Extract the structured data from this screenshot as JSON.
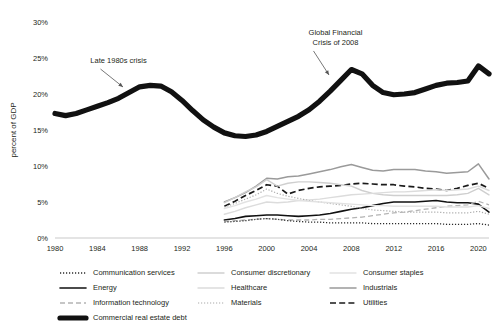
{
  "chart_data": {
    "type": "line",
    "title": "",
    "xlabel": "",
    "ylabel": "percent of GDP",
    "xlim": [
      1980,
      2021
    ],
    "ylim": [
      0,
      30
    ],
    "grid": false,
    "legend_position": "bottom",
    "x_ticks": [
      "1980",
      "1984",
      "1988",
      "1992",
      "1996",
      "2000",
      "2004",
      "2008",
      "2012",
      "2016",
      "2020"
    ],
    "y_ticks": [
      "0%",
      "5%",
      "10%",
      "15%",
      "20%",
      "25%",
      "30%"
    ],
    "annotations": [
      {
        "name": "late-1980s-crisis",
        "line1": "Late 1980s crisis",
        "line2": "",
        "x": 1986,
        "y": 24.3
      },
      {
        "name": "global-financial-crisis",
        "line1": "Global Financial",
        "line2": "Crisis of 2008",
        "x": 2006.5,
        "y": 28.2
      }
    ],
    "series": [
      {
        "name": "Commercial real estate debt",
        "style": "solid-thick",
        "color": "#111111",
        "x": [
          1980,
          1981,
          1982,
          1983,
          1984,
          1985,
          1986,
          1987,
          1988,
          1989,
          1990,
          1991,
          1992,
          1993,
          1994,
          1995,
          1996,
          1997,
          1998,
          1999,
          2000,
          2001,
          2002,
          2003,
          2004,
          2005,
          2006,
          2007,
          2008,
          2009,
          2010,
          2011,
          2012,
          2013,
          2014,
          2015,
          2016,
          2017,
          2018,
          2019,
          2020,
          2021
        ],
        "values": [
          17.3,
          17.0,
          17.3,
          17.8,
          18.3,
          18.8,
          19.4,
          20.2,
          21.0,
          21.2,
          21.1,
          20.3,
          19.1,
          17.7,
          16.4,
          15.4,
          14.6,
          14.2,
          14.1,
          14.3,
          14.8,
          15.5,
          16.2,
          16.9,
          17.8,
          19.0,
          20.4,
          21.9,
          23.4,
          22.8,
          21.2,
          20.2,
          19.9,
          20.0,
          20.2,
          20.7,
          21.2,
          21.5,
          21.6,
          21.8,
          23.9,
          22.8
        ]
      },
      {
        "name": "Industrials",
        "style": "solid-gray",
        "color": "#9a9a9a",
        "x": [
          1996,
          1997,
          1998,
          1999,
          2000,
          2001,
          2002,
          2003,
          2004,
          2005,
          2006,
          2007,
          2008,
          2009,
          2010,
          2011,
          2012,
          2013,
          2014,
          2015,
          2016,
          2017,
          2018,
          2019,
          2020,
          2021
        ],
        "values": [
          5.0,
          5.6,
          6.3,
          7.2,
          8.3,
          8.2,
          8.5,
          8.6,
          8.9,
          9.2,
          9.5,
          9.9,
          10.2,
          9.8,
          9.4,
          9.3,
          9.5,
          9.5,
          9.5,
          9.3,
          9.2,
          9.0,
          9.1,
          9.2,
          10.3,
          8.2
        ]
      },
      {
        "name": "Utilities",
        "style": "dashed-black",
        "color": "#1a1a1a",
        "x": [
          1996,
          1997,
          1998,
          1999,
          2000,
          2001,
          2002,
          2003,
          2004,
          2005,
          2006,
          2007,
          2008,
          2009,
          2010,
          2011,
          2012,
          2013,
          2014,
          2015,
          2016,
          2017,
          2018,
          2019,
          2020,
          2021
        ],
        "values": [
          4.4,
          5.1,
          5.9,
          6.6,
          7.4,
          7.2,
          6.1,
          6.6,
          6.9,
          7.1,
          7.2,
          7.3,
          7.5,
          7.6,
          7.5,
          7.4,
          7.4,
          7.2,
          7.1,
          6.9,
          6.8,
          6.6,
          6.9,
          7.3,
          7.6,
          6.9
        ]
      },
      {
        "name": "Energy",
        "style": "solid-black",
        "color": "#111111",
        "x": [
          1996,
          1997,
          1998,
          1999,
          2000,
          2001,
          2002,
          2003,
          2004,
          2005,
          2006,
          2007,
          2008,
          2009,
          2010,
          2011,
          2012,
          2013,
          2014,
          2015,
          2016,
          2017,
          2018,
          2019,
          2020,
          2021
        ],
        "values": [
          2.5,
          2.7,
          3.0,
          3.1,
          3.2,
          3.2,
          3.1,
          3.0,
          3.1,
          3.2,
          3.4,
          3.7,
          4.0,
          4.2,
          4.5,
          4.8,
          5.0,
          5.0,
          5.0,
          5.1,
          5.2,
          5.0,
          4.9,
          4.9,
          4.7,
          3.6
        ]
      },
      {
        "name": "Consumer discretionary",
        "style": "solid-light",
        "color": "#cfcfcf",
        "x": [
          1996,
          1997,
          1998,
          1999,
          2000,
          2001,
          2002,
          2003,
          2004,
          2005,
          2006,
          2007,
          2008,
          2009,
          2010,
          2011,
          2012,
          2013,
          2014,
          2015,
          2016,
          2017,
          2018,
          2019,
          2020,
          2021
        ],
        "values": [
          4.9,
          5.6,
          6.4,
          7.1,
          8.1,
          7.2,
          7.6,
          7.8,
          7.8,
          7.7,
          7.6,
          7.4,
          7.2,
          6.6,
          6.2,
          6.0,
          5.9,
          5.9,
          5.9,
          5.9,
          5.9,
          5.9,
          6.0,
          6.2,
          6.9,
          6.0
        ]
      },
      {
        "name": "Healthcare",
        "style": "solid-pale",
        "color": "#dcdcdc",
        "x": [
          1996,
          1997,
          1998,
          1999,
          2000,
          2001,
          2002,
          2003,
          2004,
          2005,
          2006,
          2007,
          2008,
          2009,
          2010,
          2011,
          2012,
          2013,
          2014,
          2015,
          2016,
          2017,
          2018,
          2019,
          2020,
          2021
        ],
        "values": [
          3.3,
          3.7,
          4.2,
          4.6,
          5.0,
          4.9,
          5.0,
          5.2,
          5.3,
          5.4,
          5.6,
          5.8,
          6.0,
          6.1,
          6.2,
          6.3,
          6.4,
          6.4,
          6.5,
          6.6,
          6.7,
          6.6,
          6.7,
          6.8,
          7.2,
          6.6
        ]
      },
      {
        "name": "Materials",
        "style": "dotted-gray",
        "color": "#aaaaaa",
        "x": [
          1996,
          1997,
          1998,
          1999,
          2000,
          2001,
          2002,
          2003,
          2004,
          2005,
          2006,
          2007,
          2008,
          2009,
          2010,
          2011,
          2012,
          2013,
          2014,
          2015,
          2016,
          2017,
          2018,
          2019,
          2020,
          2021
        ],
        "values": [
          4.3,
          4.8,
          5.4,
          6.0,
          6.8,
          6.2,
          5.8,
          5.5,
          5.2,
          5.0,
          4.8,
          4.6,
          4.4,
          4.1,
          3.9,
          3.8,
          3.7,
          3.6,
          3.6,
          3.6,
          3.6,
          3.5,
          3.5,
          3.5,
          3.7,
          3.3
        ]
      },
      {
        "name": "Information technology",
        "style": "dashed-gray",
        "color": "#b4b4b4",
        "x": [
          1996,
          1997,
          1998,
          1999,
          2000,
          2001,
          2002,
          2003,
          2004,
          2005,
          2006,
          2007,
          2008,
          2009,
          2010,
          2011,
          2012,
          2013,
          2014,
          2015,
          2016,
          2017,
          2018,
          2019,
          2020,
          2021
        ],
        "values": [
          2.3,
          2.4,
          2.5,
          2.6,
          2.7,
          2.6,
          2.5,
          2.5,
          2.5,
          2.6,
          2.6,
          2.7,
          2.8,
          2.9,
          3.1,
          3.3,
          3.5,
          3.6,
          3.8,
          4.0,
          4.2,
          4.4,
          4.5,
          4.6,
          5.1,
          4.6
        ]
      },
      {
        "name": "Communication services",
        "style": "dotted-black",
        "color": "#2b2b2b",
        "x": [
          1996,
          1997,
          1998,
          1999,
          2000,
          2001,
          2002,
          2003,
          2004,
          2005,
          2006,
          2007,
          2008,
          2009,
          2010,
          2011,
          2012,
          2013,
          2014,
          2015,
          2016,
          2017,
          2018,
          2019,
          2020,
          2021
        ],
        "values": [
          2.2,
          2.3,
          2.4,
          2.6,
          2.7,
          2.6,
          2.4,
          2.3,
          2.2,
          2.2,
          2.1,
          2.1,
          2.1,
          2.1,
          2.0,
          2.0,
          2.0,
          2.0,
          2.0,
          2.0,
          2.0,
          1.9,
          1.9,
          1.9,
          2.0,
          1.8
        ]
      },
      {
        "name": "Consumer staples",
        "style": "solid-faint",
        "color": "#e2e2e2",
        "x": [
          1996,
          1997,
          1998,
          1999,
          2000,
          2001,
          2002,
          2003,
          2004,
          2005,
          2006,
          2007,
          2008,
          2009,
          2010,
          2011,
          2012,
          2013,
          2014,
          2015,
          2016,
          2017,
          2018,
          2019,
          2020,
          2021
        ],
        "values": [
          4.1,
          4.5,
          5.0,
          5.4,
          5.9,
          5.6,
          5.4,
          5.2,
          5.1,
          5.0,
          4.9,
          4.8,
          4.7,
          4.6,
          4.5,
          4.5,
          4.4,
          4.4,
          4.4,
          4.4,
          4.4,
          4.3,
          4.3,
          4.3,
          4.5,
          4.1
        ]
      }
    ]
  },
  "legend": {
    "items": [
      {
        "label": "Communication services",
        "style": "dotted-black",
        "color": "#2b2b2b",
        "col": 0,
        "row": 0
      },
      {
        "label": "Consumer discretionary",
        "style": "solid-light",
        "color": "#cfcfcf",
        "col": 1,
        "row": 0
      },
      {
        "label": "Consumer staples",
        "style": "solid-faint",
        "color": "#e2e2e2",
        "col": 2,
        "row": 0
      },
      {
        "label": "Energy",
        "style": "solid-black",
        "color": "#111111",
        "col": 0,
        "row": 1
      },
      {
        "label": "Healthcare",
        "style": "solid-pale",
        "color": "#dcdcdc",
        "col": 1,
        "row": 1
      },
      {
        "label": "Industrials",
        "style": "solid-gray",
        "color": "#9a9a9a",
        "col": 2,
        "row": 1
      },
      {
        "label": "Information technology",
        "style": "dashed-gray",
        "color": "#b4b4b4",
        "col": 0,
        "row": 2
      },
      {
        "label": "Materials",
        "style": "dotted-gray",
        "color": "#aaaaaa",
        "col": 1,
        "row": 2
      },
      {
        "label": "Utilities",
        "style": "dashed-black",
        "color": "#1a1a1a",
        "col": 2,
        "row": 2
      },
      {
        "label": "Commercial real estate debt",
        "style": "solid-thick",
        "color": "#111111",
        "col": 0,
        "row": 3
      }
    ]
  }
}
